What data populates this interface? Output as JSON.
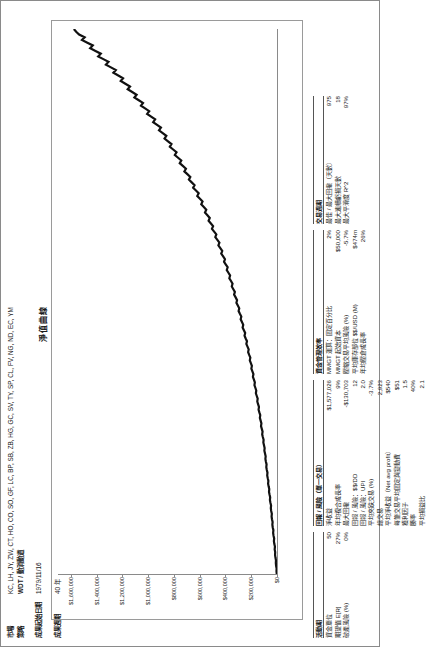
{
  "header": {
    "rows": [
      {
        "label": "市場",
        "value": "KC, LH, JY, ZW, CT, HO, CO, SO, GF, LC, BP, SB, ZB, HG, GC, SV, TY, SP, CL, FV, NG, ND, EC, YM",
        "bold": false
      },
      {
        "label": "策略",
        "value": "WDT / 動消動道",
        "bold": true
      },
      {
        "label": "",
        "value": "",
        "bold": false
      },
      {
        "label": "成果起始日期",
        "value": "1979/11/16",
        "bold": false
      },
      {
        "label": "",
        "value": "",
        "bold": false
      },
      {
        "label": "成果週期",
        "value": "40 年",
        "bold": false
      }
    ]
  },
  "chart_data": {
    "type": "line",
    "title": "淨值曲線",
    "xlabel": "",
    "ylabel": "",
    "ylim": [
      0,
      1700000
    ],
    "yticks": [
      0,
      200000,
      400000,
      600000,
      800000,
      1000000,
      1200000,
      1400000,
      1600000
    ],
    "ytick_labels": [
      "$0",
      "$200,000",
      "$400,000",
      "$600,000",
      "$800,000",
      "$1,000,000",
      "$1,200,000",
      "$1,400,000",
      "$1,600,000"
    ],
    "grid": false,
    "legend": "none",
    "series": [
      {
        "name": "淨值",
        "values": [
          2000,
          4000,
          3000,
          7000,
          9000,
          8000,
          12000,
          15000,
          14000,
          18000,
          16000,
          21000,
          24000,
          22000,
          27000,
          30000,
          28000,
          33000,
          36000,
          34000,
          39000,
          42000,
          40000,
          45000,
          48000,
          46000,
          51000,
          55000,
          53000,
          58000,
          62000,
          60000,
          65000,
          69000,
          67000,
          72000,
          76000,
          74000,
          79000,
          83000,
          81000,
          86000,
          90000,
          88000,
          93000,
          98000,
          96000,
          101000,
          106000,
          104000,
          110000,
          115000,
          112000,
          118000,
          124000,
          121000,
          127000,
          133000,
          130000,
          137000,
          143000,
          140000,
          147000,
          153000,
          150000,
          157000,
          164000,
          161000,
          168000,
          175000,
          172000,
          179000,
          187000,
          183000,
          191000,
          199000,
          195000,
          203000,
          211000,
          207000,
          216000,
          224000,
          220000,
          229000,
          238000,
          233000,
          243000,
          252000,
          247000,
          257000,
          267000,
          262000,
          272000,
          282000,
          277000,
          288000,
          298000,
          293000,
          304000,
          315000,
          310000,
          321000,
          333000,
          327000,
          339000,
          351000,
          345000,
          357000,
          370000,
          364000,
          377000,
          390000,
          383000,
          397000,
          411000,
          404000,
          418000,
          433000,
          425000,
          440000,
          455000,
          447000,
          463000,
          479000,
          471000,
          488000,
          505000,
          496000,
          513000,
          531000,
          522000,
          540000,
          559000,
          549000,
          568000,
          588000,
          578000,
          598000,
          619000,
          608000,
          629000,
          651000,
          640000,
          662000,
          684000,
          673000,
          696000,
          719000,
          707000,
          731000,
          755000,
          743000,
          768000,
          793000,
          780000,
          806000,
          832000,
          819000,
          846000,
          873000,
          859000,
          887000,
          916000,
          901000,
          931000,
          961000,
          946000,
          977000,
          1008000,
          992000,
          1024000,
          1056000,
          1040000,
          1073000,
          1107000,
          1090000,
          1124000,
          1159000,
          1141000,
          1177000,
          1213000,
          1195000,
          1232000,
          1270000,
          1251000,
          1289000,
          1328000,
          1308000,
          1348000,
          1388000,
          1368000,
          1409000,
          1450000,
          1430000,
          1472000,
          1514000,
          1493000,
          1536000,
          1559000,
          1577026
        ]
      }
    ]
  },
  "stats": {
    "col1": {
      "sections": [
        {
          "heading": "活動期",
          "rows": [
            {
              "label": "資金單位",
              "value": "50"
            },
            {
              "label": "期望值 E[R]",
              "value": "27%"
            },
            {
              "label": "破產風險 (%)",
              "value": "0%"
            }
          ]
        }
      ]
    },
    "col2": {
      "sections": [
        {
          "heading": "回報 / 風險（單一交易）",
          "rows": [
            {
              "label": "淨收益",
              "value": "$1,577,026"
            },
            {
              "label": "年均複合成長率",
              "value": "9%"
            },
            {
              "label": "最大回撤",
              "value": "-$130,703"
            },
            {
              "label": "回報 / 風險：$$/DD",
              "value": "12"
            },
            {
              "label": "回報 / 風險：UPI",
              "value": "2.0"
            },
            {
              "label": "平均夾跌交易 (%)",
              "value": "-3.7%"
            },
            {
              "label": "總交易",
              "value": "2,923"
            },
            {
              "label": "平均淨收益（Net avg profit）",
              "value": "$540"
            },
            {
              "label": "每筆交易平均固定與變動費",
              "value": "$51"
            },
            {
              "label": "獲利因子",
              "value": "1.5"
            },
            {
              "label": "勝率",
              "value": "40%"
            },
            {
              "label": "平均損益比",
              "value": "2.1"
            }
          ]
        }
      ]
    },
    "col3": {
      "sections": [
        {
          "heading": "資金管理效率",
          "rows": [
            {
              "label": "MMGT 運算：固定百分比",
              "value": "2%"
            },
            {
              "label": "MMGT 起始資本",
              "value": "$50,000"
            },
            {
              "label": "壓縮交易平均風險 (%)",
              "value": "-5.7%"
            },
            {
              "label": "平均庫存部位 $$/USD (M)",
              "value": "$474m"
            },
            {
              "label": "年均壓倉成長率",
              "value": "26%"
            }
          ]
        }
      ]
    },
    "col4": {
      "sections": [
        {
          "heading": "交易週期",
          "rows": [
            {
              "label": "最佳 / 最大回撤（天數）",
              "value": "975"
            },
            {
              "label": "最大連續虧損天數",
              "value": "18"
            },
            {
              "label": "最大平滑度 R^2",
              "value": "97%"
            }
          ]
        }
      ]
    }
  }
}
